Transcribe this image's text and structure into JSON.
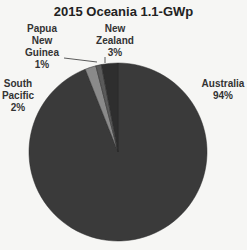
{
  "chart_data": {
    "type": "pie",
    "title": "2015 Oceania 1.1-GWp",
    "categories": [
      "Australia",
      "South Pacific",
      "Papua New Guinea",
      "New Zealand"
    ],
    "values": [
      94,
      2,
      1,
      3
    ],
    "unit": "%",
    "labels": {
      "australia": {
        "name": "Australia",
        "pct": "94%"
      },
      "south_pacific": {
        "name_1": "South",
        "name_2": "Pacific",
        "pct": "2%"
      },
      "png": {
        "name_1": "Papua",
        "name_2": "New",
        "name_3": "Guinea",
        "pct": "1%"
      },
      "nz": {
        "name_1": "New",
        "name_2": "Zealand",
        "pct": "3%"
      }
    },
    "colors": {
      "Australia": "#3a3a3a",
      "South Pacific": "#8a8a8a",
      "Papua New Guinea": "#5a5a5a",
      "New Zealand": "#2e2e2e"
    },
    "legend": "none"
  }
}
